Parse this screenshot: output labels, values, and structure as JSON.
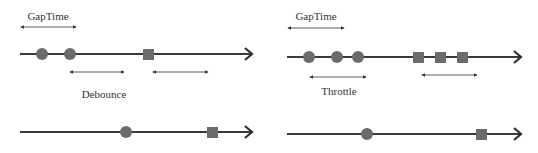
{
  "colors": {
    "line": "#3a3a3a",
    "marker": "#6b6b6b",
    "arrow": "#333333",
    "text": "#333333",
    "background": "#ffffff"
  },
  "panels": [
    {
      "name": "debounce",
      "gap_label": "GapTime",
      "mode_label": "Debounce",
      "input_events": {
        "circles": 2,
        "squares": 1
      },
      "output_events": {
        "circles": 1,
        "squares": 1
      }
    },
    {
      "name": "throttle",
      "gap_label": "GapTime",
      "mode_label": "Throttle",
      "input_events": {
        "circles": 3,
        "squares": 3
      },
      "output_events": {
        "circles": 1,
        "squares": 1
      }
    }
  ]
}
